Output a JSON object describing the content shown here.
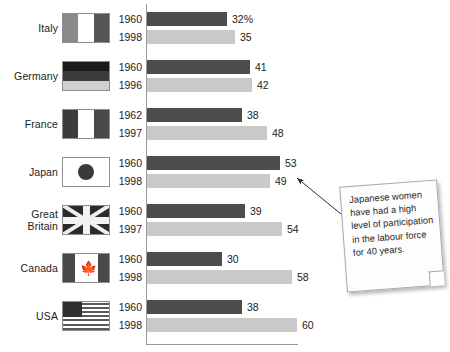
{
  "chart_data": {
    "type": "bar",
    "orientation": "horizontal",
    "title": "",
    "subtitle": "",
    "xlabel": "",
    "ylabel": "",
    "xlim": [
      0,
      62
    ],
    "grid": false,
    "legend_position": "none",
    "unit_suffix": "%",
    "categories": [
      "Italy",
      "Germany",
      "France",
      "Japan",
      "Great Britain",
      "Canada",
      "USA"
    ],
    "series": [
      {
        "name": "earlier year",
        "color": "#4d4d4d",
        "values": [
          32,
          41,
          38,
          53,
          39,
          30,
          38
        ]
      },
      {
        "name": "later year",
        "color": "#cacaca",
        "values": [
          35,
          42,
          48,
          49,
          54,
          58,
          60
        ]
      }
    ],
    "rows": [
      {
        "country": "Italy",
        "country_line1": "Italy",
        "country_line2": "",
        "flag": "flag-italy",
        "bars": [
          {
            "year": "1960",
            "value": 32,
            "label": "32%",
            "tone": "old"
          },
          {
            "year": "1998",
            "value": 35,
            "label": "35",
            "tone": "new"
          }
        ]
      },
      {
        "country": "Germany",
        "country_line1": "Germany",
        "country_line2": "",
        "flag": "flag-germany",
        "bars": [
          {
            "year": "1960",
            "value": 41,
            "label": "41",
            "tone": "old"
          },
          {
            "year": "1996",
            "value": 42,
            "label": "42",
            "tone": "new"
          }
        ]
      },
      {
        "country": "France",
        "country_line1": "France",
        "country_line2": "",
        "flag": "flag-france",
        "bars": [
          {
            "year": "1962",
            "value": 38,
            "label": "38",
            "tone": "old"
          },
          {
            "year": "1997",
            "value": 48,
            "label": "48",
            "tone": "new"
          }
        ]
      },
      {
        "country": "Japan",
        "country_line1": "Japan",
        "country_line2": "",
        "flag": "flag-japan",
        "bars": [
          {
            "year": "1960",
            "value": 53,
            "label": "53",
            "tone": "old"
          },
          {
            "year": "1998",
            "value": 49,
            "label": "49",
            "tone": "new"
          }
        ]
      },
      {
        "country": "Great Britain",
        "country_line1": "Great",
        "country_line2": "Britain",
        "flag": "flag-great-britain",
        "bars": [
          {
            "year": "1960",
            "value": 39,
            "label": "39",
            "tone": "old"
          },
          {
            "year": "1997",
            "value": 54,
            "label": "54",
            "tone": "new"
          }
        ]
      },
      {
        "country": "Canada",
        "country_line1": "Canada",
        "country_line2": "",
        "flag": "flag-canada",
        "bars": [
          {
            "year": "1960",
            "value": 30,
            "label": "30",
            "tone": "old"
          },
          {
            "year": "1998",
            "value": 58,
            "label": "58",
            "tone": "new"
          }
        ]
      },
      {
        "country": "USA",
        "country_line1": "USA",
        "country_line2": "",
        "flag": "flag-usa",
        "bars": [
          {
            "year": "1960",
            "value": 38,
            "label": "38",
            "tone": "old"
          },
          {
            "year": "1998",
            "value": 60,
            "label": "60",
            "tone": "new"
          }
        ]
      }
    ],
    "annotations": [
      {
        "text": "Japanese women have had a high level of participation in the labour force for 40 years.",
        "points_to": "Japan 1960 bar"
      }
    ]
  },
  "colors": {
    "bar_old": "#4d4d4d",
    "bar_new": "#cacaca",
    "axis": "#9a9a9a",
    "text": "#1b1b1b",
    "note_bg": "#fdfdfd",
    "note_border": "#a8a8a8"
  }
}
